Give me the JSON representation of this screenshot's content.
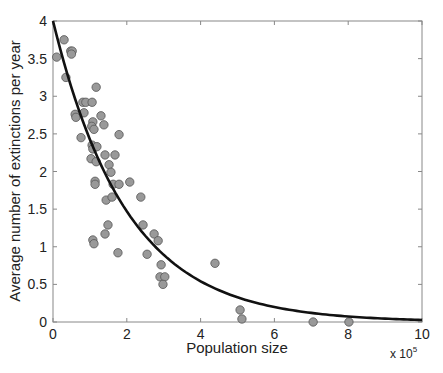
{
  "chart_data": {
    "type": "scatter",
    "title": "",
    "xlabel": "Population size",
    "ylabel": "Average number of extinctions per year",
    "x_multiplier_label": "x 10",
    "x_multiplier_exponent": "5",
    "xlim": [
      0,
      10
    ],
    "ylim": [
      0,
      4
    ],
    "xticks": [
      0,
      2,
      4,
      6,
      8,
      10
    ],
    "yticks": [
      0,
      0.5,
      1,
      1.5,
      2,
      2.5,
      3,
      3.5,
      4
    ],
    "xtick_labels": [
      "0",
      "2",
      "4",
      "6",
      "8",
      "10"
    ],
    "ytick_labels": [
      "0",
      "0.5",
      "1",
      "1.5",
      "2",
      "2.5",
      "3",
      "3.5",
      "4"
    ],
    "grid": false,
    "legend": null,
    "series": [
      {
        "name": "observations",
        "kind": "scatter",
        "marker_color": "#999999",
        "marker_edge": "#555555",
        "x": [
          0.3,
          0.1,
          0.48,
          0.52,
          0.5,
          0.35,
          1.17,
          0.81,
          0.89,
          1.06,
          0.6,
          0.62,
          0.84,
          1.3,
          1.08,
          1.05,
          1.11,
          1.38,
          1.79,
          0.76,
          1.06,
          1.08,
          1.19,
          1.03,
          1.17,
          1.41,
          1.68,
          1.52,
          1.57,
          1.14,
          1.14,
          1.63,
          1.79,
          2.08,
          1.44,
          1.6,
          2.38,
          1.49,
          1.41,
          1.08,
          1.11,
          2.44,
          2.74,
          2.85,
          1.76,
          2.55,
          2.93,
          2.9,
          3.03,
          2.98,
          4.39,
          5.07,
          5.12,
          7.05,
          8.02
        ],
        "y": [
          3.75,
          3.52,
          3.6,
          3.6,
          3.56,
          3.25,
          3.12,
          2.92,
          2.92,
          2.92,
          2.76,
          2.72,
          2.78,
          2.74,
          2.66,
          2.6,
          2.56,
          2.62,
          2.49,
          2.45,
          2.35,
          2.3,
          2.33,
          2.17,
          2.13,
          2.22,
          2.22,
          2.09,
          1.99,
          1.87,
          1.83,
          1.83,
          1.83,
          1.86,
          1.62,
          1.66,
          1.66,
          1.29,
          1.17,
          1.09,
          1.04,
          1.29,
          1.17,
          1.08,
          0.92,
          0.9,
          0.76,
          0.6,
          0.6,
          0.5,
          0.78,
          0.16,
          0.04,
          0.0,
          0.0
        ]
      },
      {
        "name": "fit",
        "kind": "line",
        "formula": "y = 4 * exp(-x / 2)",
        "line_color": "#111111",
        "x": [
          0,
          0.5,
          1,
          1.5,
          2,
          2.5,
          3,
          3.5,
          4,
          4.5,
          5,
          5.5,
          6,
          6.5,
          7,
          7.5,
          8,
          8.5,
          9,
          9.5,
          10
        ],
        "y": [
          4.0,
          3.115,
          2.426,
          1.89,
          1.472,
          1.146,
          0.893,
          0.695,
          0.541,
          0.422,
          0.328,
          0.256,
          0.199,
          0.155,
          0.121,
          0.094,
          0.073,
          0.057,
          0.044,
          0.035,
          0.027
        ]
      }
    ]
  }
}
